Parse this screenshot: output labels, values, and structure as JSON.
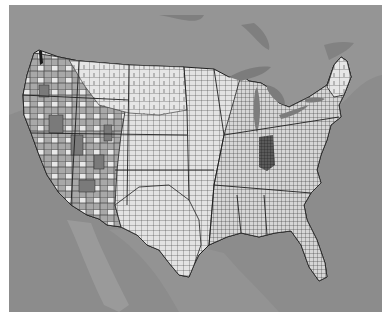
{
  "map": {
    "title": "",
    "region": "Contiguous United States",
    "granularity": "county",
    "colors": {
      "page_background": "#ffffff",
      "water": "#8c8c8c",
      "foreign_land": "#939393",
      "lakes": "#7e7e7e",
      "county_light": "#e6e6e6",
      "county_mid": "#a6a6a6",
      "county_dark": "#4a4a4a",
      "county_border": "#3a3a3a",
      "state_border": "#1e1e1e"
    },
    "legend": null,
    "labels": []
  }
}
